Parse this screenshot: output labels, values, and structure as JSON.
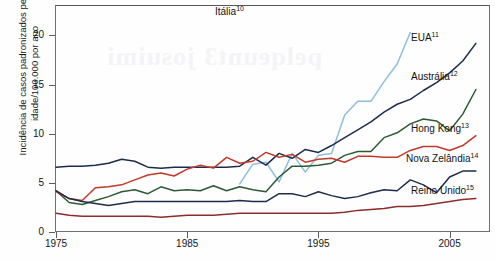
{
  "chart_data": {
    "type": "line",
    "title": "",
    "subtitle": "",
    "xlabel": "",
    "ylabel": "Incidência de casos padronizados pela idade/100.000 por ano",
    "xlim": [
      1975,
      2008
    ],
    "ylim": [
      0,
      23
    ],
    "xticks": [
      1975,
      1985,
      1995,
      2005
    ],
    "yticks": [
      0,
      5,
      10,
      15,
      20
    ],
    "grid": false,
    "legend_position": "inline-right",
    "series": [
      {
        "name": "Itália",
        "superscript": "10",
        "color": "#8fbedd",
        "x": [
          1989,
          1990,
          1991,
          1992,
          1993,
          1994,
          1995,
          1996,
          1997,
          1998,
          1999,
          2000,
          2001,
          2002
        ],
        "values": [
          4.9,
          6.9,
          7.1,
          5.1,
          8.0,
          6.1,
          7.8,
          8.0,
          11.9,
          13.3,
          13.3,
          15.3,
          17.1,
          20.3
        ]
      },
      {
        "name": "EUA",
        "superscript": "11",
        "color": "#1d2c4d",
        "x": [
          1975,
          1976,
          1977,
          1978,
          1979,
          1980,
          1981,
          1982,
          1983,
          1984,
          1985,
          1986,
          1987,
          1988,
          1989,
          1990,
          1991,
          1992,
          1993,
          1994,
          1995,
          1996,
          1997,
          1998,
          1999,
          2000,
          2001,
          2002,
          2003,
          2004,
          2005,
          2006,
          2007
        ],
        "values": [
          6.6,
          6.7,
          6.7,
          6.8,
          7.0,
          7.4,
          7.2,
          6.6,
          6.5,
          6.6,
          6.6,
          6.6,
          6.6,
          6.6,
          6.7,
          7.6,
          6.8,
          8.0,
          7.5,
          8.4,
          8.1,
          8.8,
          9.6,
          10.4,
          11.2,
          12.2,
          13.0,
          13.5,
          14.4,
          15.2,
          16.2,
          17.4,
          19.2
        ]
      },
      {
        "name": "Austrália",
        "superscript": "12",
        "color": "#2c5b33",
        "x": [
          1975,
          1976,
          1977,
          1978,
          1979,
          1980,
          1981,
          1982,
          1983,
          1984,
          1985,
          1986,
          1987,
          1988,
          1989,
          1990,
          1991,
          1992,
          1993,
          1994,
          1995,
          1996,
          1997,
          1998,
          1999,
          2000,
          2001,
          2002,
          2003,
          2004,
          2005,
          2006,
          2007
        ],
        "values": [
          4.2,
          3.0,
          2.8,
          3.2,
          3.6,
          4.1,
          4.3,
          3.9,
          4.6,
          4.2,
          4.3,
          4.2,
          4.7,
          4.2,
          4.6,
          4.3,
          4.1,
          5.6,
          6.7,
          6.7,
          6.8,
          7.0,
          7.8,
          8.2,
          8.2,
          9.6,
          10.1,
          11.0,
          11.5,
          11.3,
          10.3,
          12.0,
          14.5
        ]
      },
      {
        "name": "Hong Kong",
        "superscript": "13",
        "color": "#c0392b",
        "x": [
          1975,
          1976,
          1977,
          1978,
          1979,
          1980,
          1981,
          1982,
          1983,
          1984,
          1985,
          1986,
          1987,
          1988,
          1989,
          1990,
          1991,
          1992,
          1993,
          1994,
          1995,
          1996,
          1997,
          1998,
          1999,
          2000,
          2001,
          2002,
          2003,
          2004,
          2005,
          2006,
          2007
        ],
        "values": [
          4.1,
          3.4,
          3.2,
          4.5,
          4.6,
          4.8,
          5.3,
          5.8,
          6.0,
          5.7,
          6.4,
          6.8,
          6.5,
          7.6,
          7.0,
          7.2,
          8.1,
          7.6,
          7.9,
          7.1,
          7.4,
          7.5,
          7.1,
          7.7,
          7.7,
          7.6,
          7.6,
          8.3,
          8.7,
          8.7,
          8.3,
          8.8,
          9.8
        ]
      },
      {
        "name": "Nova Zelândia",
        "superscript": "14",
        "color": "#1d2c4d",
        "x": [
          1975,
          1976,
          1977,
          1978,
          1979,
          1980,
          1981,
          1982,
          1983,
          1984,
          1985,
          1986,
          1987,
          1988,
          1989,
          1990,
          1991,
          1992,
          1993,
          1994,
          1995,
          1996,
          1997,
          1998,
          1999,
          2000,
          2001,
          2002,
          2003,
          2004,
          2005,
          2006,
          2007
        ],
        "values": [
          4.2,
          3.4,
          3.1,
          2.9,
          2.7,
          2.9,
          3.1,
          3.1,
          3.1,
          3.1,
          3.1,
          3.1,
          3.1,
          3.1,
          3.2,
          3.1,
          3.1,
          3.9,
          3.9,
          3.6,
          4.1,
          3.7,
          3.4,
          3.6,
          4.0,
          4.3,
          4.2,
          5.3,
          4.8,
          4.0,
          5.6,
          6.2,
          6.2
        ]
      },
      {
        "name": "Reino Unido",
        "superscript": "15",
        "color": "#8e2c2c",
        "x": [
          1975,
          1976,
          1977,
          1978,
          1979,
          1980,
          1981,
          1982,
          1983,
          1984,
          1985,
          1986,
          1987,
          1988,
          1989,
          1990,
          1991,
          1992,
          1993,
          1994,
          1995,
          1996,
          1997,
          1998,
          1999,
          2000,
          2001,
          2002,
          2003,
          2004,
          2005,
          2006,
          2007
        ],
        "values": [
          1.9,
          1.7,
          1.6,
          1.6,
          1.6,
          1.6,
          1.6,
          1.6,
          1.5,
          1.6,
          1.7,
          1.7,
          1.7,
          1.8,
          1.9,
          1.9,
          1.9,
          1.9,
          1.9,
          1.9,
          1.9,
          1.9,
          2.0,
          2.2,
          2.3,
          2.4,
          2.6,
          2.6,
          2.7,
          2.9,
          3.1,
          3.3,
          3.4
        ]
      }
    ],
    "labels": [
      {
        "name": "Itália",
        "superscript": "10",
        "x": 215,
        "y": 5
      },
      {
        "name": "EUA",
        "superscript": "11",
        "x": 411,
        "y": 31
      },
      {
        "name": "Austrália",
        "superscript": "12",
        "x": 411,
        "y": 70
      },
      {
        "name": "Hong Kong",
        "superscript": "13",
        "x": 411,
        "y": 122
      },
      {
        "name": "Nova Zelândia",
        "superscript": "14",
        "x": 406,
        "y": 152
      },
      {
        "name": "Reino Unido",
        "superscript": "15",
        "x": 411,
        "y": 184
      }
    ],
    "showthrough_text": "pelqeunt3 josuimi"
  }
}
